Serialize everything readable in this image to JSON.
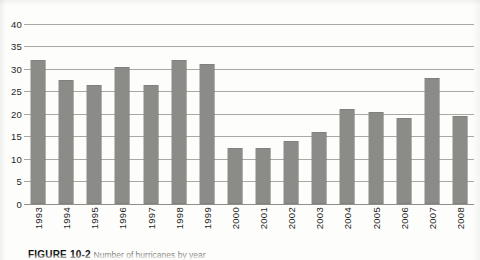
{
  "chart_data": {
    "type": "bar",
    "title": "",
    "xlabel": "",
    "ylabel": "",
    "ylim": [
      0,
      40
    ],
    "ytick_values": [
      40,
      35,
      30,
      25,
      20,
      15,
      10,
      5,
      0
    ],
    "ytick_labels": [
      "40",
      "35",
      "30",
      "25",
      "20",
      "15",
      "10",
      "5",
      "0"
    ],
    "grid": true,
    "legend": "none",
    "bar_color": "#8b8b87",
    "categories": [
      "1993",
      "1994",
      "1995",
      "1996",
      "1997",
      "1998",
      "1999",
      "2000",
      "2001",
      "2002",
      "2003",
      "2004",
      "2005",
      "2006",
      "2007",
      "2008"
    ],
    "values": [
      32,
      27.5,
      26.5,
      30.5,
      26.5,
      32,
      31,
      12.5,
      12.5,
      14,
      16,
      21,
      20.5,
      19,
      28,
      19.5
    ]
  },
  "caption": {
    "label": "FIGURE 10-2",
    "text": "Number of hurricanes by year"
  }
}
